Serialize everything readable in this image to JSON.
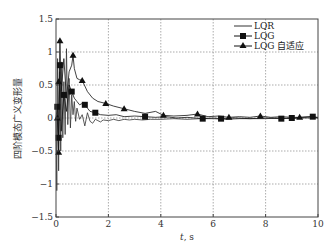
{
  "chart_data": {
    "type": "line",
    "title": "",
    "xlabel": "t, s",
    "xlabel_italic_part": "t",
    "xlabel_rest": ", s",
    "ylabel": "四阶模态广义变形量",
    "xlim": [
      0,
      10
    ],
    "ylim": [
      -1.5,
      1.5
    ],
    "xticks": [
      0,
      2,
      4,
      6,
      8,
      10
    ],
    "xtick_labels": [
      "0",
      "2",
      "4",
      "6",
      "8",
      "10"
    ],
    "yticks": [
      -1.5,
      -1,
      -0.5,
      0,
      0.5,
      1,
      1.5
    ],
    "ytick_labels": [
      "-1.5",
      "-1",
      "-0.5",
      "0",
      "0.5",
      "1",
      "1.5"
    ],
    "grid": true,
    "legend_position": "top-right",
    "series": [
      {
        "name": "LQR",
        "marker": "none",
        "color": "#333333",
        "x": [
          0,
          0.03,
          0.06,
          0.1,
          0.14,
          0.18,
          0.22,
          0.26,
          0.3,
          0.35,
          0.4,
          0.45,
          0.5,
          0.55,
          0.6,
          0.65,
          0.7,
          0.75,
          0.8,
          0.9,
          1.0,
          1.1,
          1.2,
          1.3,
          1.4,
          1.5,
          1.6,
          1.7,
          1.8,
          2.0,
          2.2,
          2.4,
          2.6,
          2.8,
          3.0,
          3.3,
          3.6,
          4.0,
          4.5,
          5.0,
          5.5,
          6.0,
          6.5,
          7.0,
          7.5,
          8.0,
          8.5,
          9.0,
          9.5,
          10.0
        ],
        "y": [
          0,
          -1.1,
          0.9,
          -0.8,
          0.7,
          -0.5,
          0.85,
          -0.3,
          0.55,
          -0.25,
          1.05,
          -0.1,
          0.6,
          -0.15,
          0.35,
          0.05,
          0.25,
          -0.05,
          0.15,
          -0.02,
          0.05,
          -0.12,
          0.08,
          -0.05,
          -0.08,
          -0.02,
          -0.04,
          -0.06,
          -0.03,
          -0.04,
          -0.02,
          -0.04,
          -0.02,
          -0.03,
          -0.02,
          -0.03,
          -0.02,
          -0.02,
          -0.01,
          -0.02,
          -0.01,
          -0.01,
          -0.02,
          -0.01,
          -0.01,
          -0.01,
          0.0,
          -0.01,
          0.0,
          0.0
        ]
      },
      {
        "name": "LQG",
        "marker": "square",
        "color": "#111111",
        "x": [
          0,
          0.05,
          0.1,
          0.15,
          0.2,
          0.3,
          0.4,
          0.5,
          0.6,
          0.7,
          0.8,
          0.9,
          1.0,
          1.1,
          1.2,
          1.3,
          1.5,
          1.7,
          2.0,
          2.3,
          2.6,
          3.0,
          3.4,
          3.8,
          4.2,
          4.6,
          5.0,
          5.6,
          6.0,
          6.3,
          6.8,
          7.4,
          8.0,
          8.6,
          9.0,
          9.4,
          9.8,
          10.0
        ],
        "y": [
          0,
          0.17,
          -0.3,
          0.8,
          -0.2,
          0.35,
          0.1,
          0.5,
          0.4,
          0.3,
          0.25,
          0.2,
          0.22,
          0.2,
          0.15,
          0.1,
          0.08,
          0.05,
          0.04,
          0.05,
          0.02,
          0.03,
          0.02,
          0.01,
          0.02,
          0.0,
          0.01,
          -0.01,
          0.0,
          -0.01,
          0.0,
          -0.01,
          0.0,
          -0.01,
          0.0,
          0.01,
          0.02,
          0.0
        ],
        "markers_at": [
          [
            0.05,
            0.17
          ],
          [
            0.1,
            -0.3
          ],
          [
            0.15,
            0.8
          ],
          [
            0.3,
            0.35
          ],
          [
            0.6,
            0.4
          ],
          [
            1.1,
            0.2
          ],
          [
            1.5,
            0.08
          ],
          [
            3.4,
            0.02
          ],
          [
            5.6,
            -0.01
          ],
          [
            6.3,
            -0.01
          ],
          [
            8.6,
            -0.01
          ],
          [
            9.0,
            0.0
          ],
          [
            9.8,
            0.02
          ]
        ]
      },
      {
        "name": "LQG 自适应",
        "marker": "triangle",
        "color": "#111111",
        "x": [
          0,
          0.05,
          0.1,
          0.12,
          0.15,
          0.2,
          0.3,
          0.4,
          0.5,
          0.6,
          0.65,
          0.7,
          0.8,
          0.9,
          1.0,
          1.2,
          1.4,
          1.6,
          1.9,
          2.2,
          2.6,
          3.0,
          3.4,
          3.8,
          4.1,
          4.5,
          5.0,
          5.4,
          5.8,
          6.2,
          6.6,
          7.0,
          7.4,
          7.8,
          8.2,
          8.6,
          9.0,
          9.3,
          9.7,
          10.0
        ],
        "y": [
          0,
          0.0,
          -0.52,
          0.55,
          1.17,
          0.4,
          0.9,
          0.3,
          0.7,
          0.8,
          0.95,
          0.75,
          0.6,
          0.58,
          0.57,
          0.4,
          0.3,
          0.25,
          0.22,
          0.18,
          0.14,
          0.1,
          0.07,
          0.1,
          0.04,
          0.03,
          0.04,
          0.06,
          0.02,
          0.03,
          0.01,
          0.02,
          0.01,
          0.03,
          0.01,
          0.02,
          0.01,
          0.01,
          0.02,
          0.01
        ],
        "markers_at": [
          [
            0.05,
            0.0
          ],
          [
            0.1,
            -0.52
          ],
          [
            0.1,
            0.55
          ],
          [
            0.15,
            1.17
          ],
          [
            0.65,
            0.95
          ],
          [
            1.0,
            0.57
          ],
          [
            1.9,
            0.22
          ],
          [
            2.6,
            0.14
          ],
          [
            4.1,
            0.04
          ],
          [
            5.4,
            0.06
          ],
          [
            6.6,
            0.01
          ],
          [
            7.8,
            0.03
          ],
          [
            9.3,
            0.01
          ]
        ]
      }
    ]
  }
}
